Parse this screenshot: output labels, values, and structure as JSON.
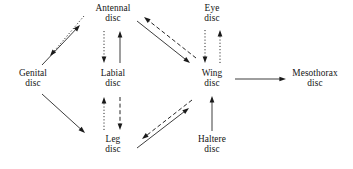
{
  "diagram": {
    "type": "directed-graph",
    "width": 353,
    "height": 169,
    "background_color": "#ffffff",
    "line_color": "#1a1a1a",
    "text_color": "#141414",
    "nodes": [
      {
        "id": "antennal",
        "line1": "Antennal",
        "line2": "disc",
        "x": 113,
        "y": 14
      },
      {
        "id": "eye",
        "line1": "Eye",
        "line2": "disc",
        "x": 212,
        "y": 14
      },
      {
        "id": "genital",
        "line1": "Genital",
        "line2": "disc",
        "x": 33,
        "y": 79
      },
      {
        "id": "labial",
        "line1": "Labial",
        "line2": "disc",
        "x": 113,
        "y": 79
      },
      {
        "id": "wing",
        "line1": "Wing",
        "line2": "disc",
        "x": 212,
        "y": 79
      },
      {
        "id": "mesothorax",
        "line1": "Mesothorax",
        "line2": "disc",
        "x": 315,
        "y": 79
      },
      {
        "id": "leg",
        "line1": "Leg",
        "line2": "disc",
        "x": 113,
        "y": 145
      },
      {
        "id": "haltere",
        "line1": "Haltere",
        "line2": "disc",
        "x": 212,
        "y": 145
      }
    ],
    "edges": [
      {
        "id": "antennal-to-genital",
        "from": "antennal",
        "to": "genital",
        "style": "dotted",
        "x1": 84,
        "y1": 16,
        "x2": 50,
        "y2": 56
      },
      {
        "id": "genital-to-antennal",
        "from": "genital",
        "to": "antennal",
        "style": "solid",
        "x1": 42,
        "y1": 65,
        "x2": 80,
        "y2": 25
      },
      {
        "id": "antennal-to-labial",
        "from": "antennal",
        "to": "labial",
        "style": "dotted",
        "x1": 104,
        "y1": 31,
        "x2": 104,
        "y2": 63
      },
      {
        "id": "labial-to-antennal",
        "from": "labial",
        "to": "antennal",
        "style": "solid",
        "x1": 120,
        "y1": 63,
        "x2": 120,
        "y2": 31
      },
      {
        "id": "antennal-to-wing",
        "from": "antennal",
        "to": "wing",
        "style": "solid",
        "x1": 137,
        "y1": 21,
        "x2": 190,
        "y2": 63
      },
      {
        "id": "wing-to-antennal",
        "from": "wing",
        "to": "antennal",
        "style": "dashed",
        "x1": 196,
        "y1": 58,
        "x2": 144,
        "y2": 17
      },
      {
        "id": "eye-to-wing",
        "from": "eye",
        "to": "wing",
        "style": "dotted",
        "x1": 205,
        "y1": 30,
        "x2": 205,
        "y2": 63
      },
      {
        "id": "wing-to-eye",
        "from": "wing",
        "to": "eye",
        "style": "dotted",
        "x1": 220,
        "y1": 63,
        "x2": 220,
        "y2": 30
      },
      {
        "id": "wing-to-mesothorax",
        "from": "wing",
        "to": "mesothorax",
        "style": "solid",
        "x1": 235,
        "y1": 79,
        "x2": 286,
        "y2": 79
      },
      {
        "id": "genital-to-leg",
        "from": "genital",
        "to": "leg",
        "style": "solid",
        "x1": 42,
        "y1": 94,
        "x2": 85,
        "y2": 133
      },
      {
        "id": "leg-to-labial",
        "from": "leg",
        "to": "labial",
        "style": "dotted",
        "x1": 104,
        "y1": 130,
        "x2": 104,
        "y2": 97
      },
      {
        "id": "labial-to-leg",
        "from": "labial",
        "to": "leg",
        "style": "dashed",
        "x1": 120,
        "y1": 97,
        "x2": 120,
        "y2": 130
      },
      {
        "id": "wing-to-leg",
        "from": "wing",
        "to": "leg",
        "style": "dashed",
        "x1": 192,
        "y1": 100,
        "x2": 142,
        "y2": 139
      },
      {
        "id": "leg-to-wing",
        "from": "leg",
        "to": "wing",
        "style": "solid",
        "x1": 137,
        "y1": 148,
        "x2": 189,
        "y2": 108
      },
      {
        "id": "haltere-to-wing",
        "from": "haltere",
        "to": "wing",
        "style": "solid",
        "x1": 212,
        "y1": 131,
        "x2": 212,
        "y2": 96
      }
    ],
    "line_styles": {
      "solid": "none",
      "dashed": "4,2.6",
      "dotted": "1.1,2.1"
    }
  }
}
